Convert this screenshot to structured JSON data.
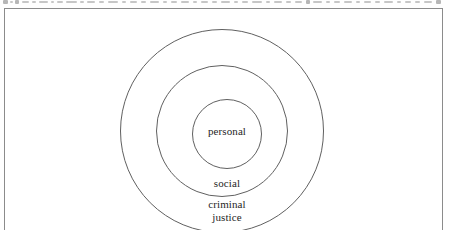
{
  "figure": {
    "caption_remnant": "",
    "frame": {
      "border_color": "#8b8b8b",
      "background": "#ffffff",
      "cropped_at_bottom": true
    }
  },
  "diagram": {
    "type": "concentric-circles",
    "stroke_color": "#606060",
    "text_color": "#262626",
    "center": {
      "x": 217,
      "y": 122
    },
    "rings": [
      {
        "name": "criminal-justice",
        "label": "criminal\njustice",
        "radius": 102,
        "level": 3
      },
      {
        "name": "social",
        "label": "social",
        "radius": 66,
        "level": 2
      },
      {
        "name": "personal",
        "label": "personal",
        "radius": 35,
        "level": 1
      }
    ],
    "labels": {
      "innermost": "personal",
      "middle": "social",
      "outermost_line1": "criminal",
      "outermost_line2": "justice",
      "outermost": "criminal\njustice"
    }
  }
}
